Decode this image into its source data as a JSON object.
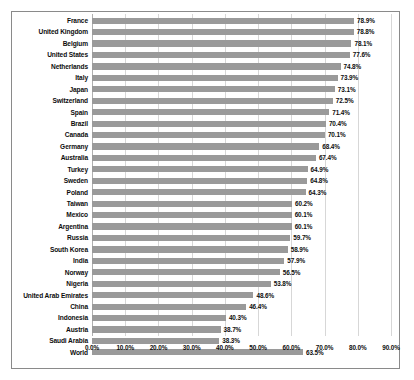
{
  "chart_data": {
    "type": "bar",
    "orientation": "horizontal",
    "title": "",
    "subtitle": "",
    "xlabel": "",
    "ylabel": "",
    "xlim": [
      0,
      90
    ],
    "grid": true,
    "legend": null,
    "value_suffix": "%",
    "bar_color": "#9a9a9a",
    "x_ticks": [
      "0.0%",
      "10.0%",
      "20.0%",
      "30.0%",
      "40.0%",
      "50.0%",
      "60.0%",
      "70.0%",
      "80.0%",
      "90.0%"
    ],
    "x_tick_values": [
      0,
      10,
      20,
      30,
      40,
      50,
      60,
      70,
      80,
      90
    ],
    "categories": [
      "France",
      "United Kingdom",
      "Belgium",
      "United States",
      "Netherlands",
      "Italy",
      "Japan",
      "Switzerland",
      "Spain",
      "Brazil",
      "Canada",
      "Germany",
      "Australia",
      "Turkey",
      "Sweden",
      "Poland",
      "Taiwan",
      "Mexico",
      "Argentina",
      "Russia",
      "South Korea",
      "India",
      "Norway",
      "Nigeria",
      "United Arab Emirates",
      "China",
      "Indonesia",
      "Austria",
      "Saudi Arabia",
      "World"
    ],
    "values": [
      78.9,
      78.8,
      78.1,
      77.6,
      74.8,
      73.9,
      73.1,
      72.5,
      71.4,
      70.4,
      70.1,
      68.4,
      67.4,
      64.9,
      64.8,
      64.3,
      60.2,
      60.1,
      60.1,
      59.7,
      58.9,
      57.9,
      56.5,
      53.8,
      48.6,
      46.4,
      40.3,
      38.7,
      38.3,
      63.5
    ],
    "data_labels": [
      "78.9%",
      "78.8%",
      "78.1%",
      "77.6%",
      "74.8%",
      "73.9%",
      "73.1%",
      "72.5%",
      "71.4%",
      "70.4%",
      "70.1%",
      "68.4%",
      "67.4%",
      "64.9%",
      "64.8%",
      "64.3%",
      "60.2%",
      "60.1%",
      "60.1%",
      "59.7%",
      "58.9%",
      "57.9%",
      "56.5%",
      "53.8%",
      "48.6%",
      "46.4%",
      "40.3%",
      "38.7%",
      "38.3%",
      "63.5%"
    ]
  }
}
